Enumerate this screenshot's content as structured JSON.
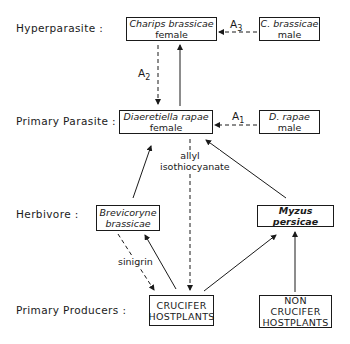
{
  "levels": {
    "hyperparasite": "Hyperparasite :",
    "primary_parasite": "Primary  Parasite :",
    "herbivore": "Herbivore :",
    "primary_producers": "Primary Producers :"
  },
  "nodes": {
    "charips_female": {
      "species": "Charips brassicae",
      "sex": "female"
    },
    "charips_male": {
      "species": "C. brassicae",
      "sex": "male"
    },
    "diaeretiella_female": {
      "species": "Diaeretiella rapae",
      "sex": "female"
    },
    "diaeretiella_male": {
      "species": "D. rapae",
      "sex": "male"
    },
    "brevicoryne": {
      "line1": "Brevicoryne",
      "line2": "brassicae"
    },
    "myzus": {
      "species": "Myzus persicae"
    },
    "crucifer": {
      "line1": "CRUCIFER",
      "line2": "HOSTPLANTS"
    },
    "non_crucifer": {
      "line1": "NON CRUCIFER",
      "line2": "HOSTPLANTS"
    }
  },
  "edge_labels": {
    "a1": "A",
    "a1_sub": "1",
    "a2": "A",
    "a2_sub": "2",
    "a3": "A",
    "a3_sub": "3",
    "allyl_line1": "allyl",
    "allyl_line2": "isothiocyanate",
    "sinigrin": "sinigrin"
  }
}
